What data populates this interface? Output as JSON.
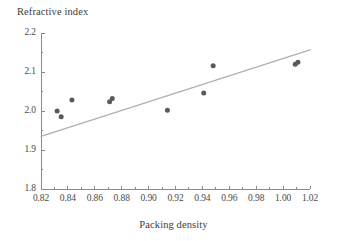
{
  "chart_data": {
    "type": "scatter",
    "title": "",
    "xlabel": "Packing density",
    "ylabel": "Refractive index",
    "xlim": [
      0.82,
      1.02
    ],
    "ylim": [
      1.8,
      2.2
    ],
    "grid": false,
    "legend": "none",
    "x_ticks": [
      "0.82",
      "0.84",
      "0.86",
      "0.88",
      "0.90",
      "0.92",
      "0.94",
      "0.96",
      "0.98",
      "1.00",
      "1.02"
    ],
    "x_tick_values": [
      0.82,
      0.84,
      0.86,
      0.88,
      0.9,
      0.92,
      0.94,
      0.96,
      0.98,
      1.0,
      1.02
    ],
    "y_ticks": [
      "2.2",
      "2.1",
      "2.0",
      "1.9",
      "1.8"
    ],
    "y_tick_values": [
      2.2,
      2.1,
      2.0,
      1.9,
      1.8
    ],
    "x_minor_step": 0.01,
    "y_minor_step": 0.05,
    "points": [
      {
        "x": 0.832,
        "y": 2.0
      },
      {
        "x": 0.835,
        "y": 1.985
      },
      {
        "x": 0.843,
        "y": 2.028
      },
      {
        "x": 0.871,
        "y": 2.024
      },
      {
        "x": 0.873,
        "y": 2.032
      },
      {
        "x": 0.914,
        "y": 2.002
      },
      {
        "x": 0.941,
        "y": 2.046
      },
      {
        "x": 0.948,
        "y": 2.116
      },
      {
        "x": 1.009,
        "y": 2.12
      },
      {
        "x": 1.011,
        "y": 2.125
      }
    ],
    "trend_line": {
      "x1": 0.82,
      "y1": 1.935,
      "x2": 1.02,
      "y2": 2.157
    },
    "colors": {
      "marker": "#5a5a5a",
      "trend_line": "#b0b0b0",
      "axis": "#8a8a8a",
      "text": "#3d3d3d",
      "background": "#ffffff"
    }
  }
}
